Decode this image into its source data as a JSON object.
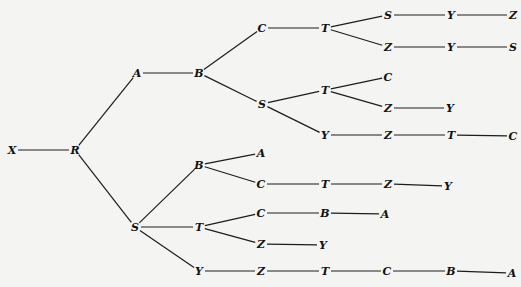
{
  "diagram": {
    "type": "tree",
    "orientation": "left-to-right",
    "colors": {
      "background": "#f4f4f2",
      "ink": "#111111"
    },
    "nodes": [
      {
        "id": "n0",
        "label": "X",
        "x": 12,
        "y": 150
      },
      {
        "id": "n1",
        "label": "R",
        "x": 75,
        "y": 150
      },
      {
        "id": "n2",
        "label": "A",
        "x": 137,
        "y": 73
      },
      {
        "id": "n3",
        "label": "B",
        "x": 199,
        "y": 73
      },
      {
        "id": "n4",
        "label": "C",
        "x": 262,
        "y": 28
      },
      {
        "id": "n5",
        "label": "T",
        "x": 325,
        "y": 28
      },
      {
        "id": "n6",
        "label": "S",
        "x": 388,
        "y": 15
      },
      {
        "id": "n7",
        "label": "Y",
        "x": 451,
        "y": 15
      },
      {
        "id": "n8",
        "label": "Z",
        "x": 513,
        "y": 15
      },
      {
        "id": "n9",
        "label": "Z",
        "x": 388,
        "y": 47
      },
      {
        "id": "n10",
        "label": "Y",
        "x": 451,
        "y": 47
      },
      {
        "id": "n11",
        "label": "S",
        "x": 513,
        "y": 47
      },
      {
        "id": "n12",
        "label": "S",
        "x": 262,
        "y": 104
      },
      {
        "id": "n13",
        "label": "T",
        "x": 325,
        "y": 90
      },
      {
        "id": "n14",
        "label": "C",
        "x": 388,
        "y": 77
      },
      {
        "id": "n15",
        "label": "Z",
        "x": 388,
        "y": 108
      },
      {
        "id": "n16",
        "label": "Y",
        "x": 450,
        "y": 108
      },
      {
        "id": "n17",
        "label": "Y",
        "x": 325,
        "y": 135
      },
      {
        "id": "n18",
        "label": "Z",
        "x": 388,
        "y": 135
      },
      {
        "id": "n19",
        "label": "T",
        "x": 451,
        "y": 135
      },
      {
        "id": "n20",
        "label": "C",
        "x": 513,
        "y": 136
      },
      {
        "id": "n21",
        "label": "S",
        "x": 135,
        "y": 227
      },
      {
        "id": "n22",
        "label": "B",
        "x": 199,
        "y": 165
      },
      {
        "id": "n23",
        "label": "A",
        "x": 261,
        "y": 153
      },
      {
        "id": "n24",
        "label": "C",
        "x": 261,
        "y": 184
      },
      {
        "id": "n25",
        "label": "T",
        "x": 325,
        "y": 184
      },
      {
        "id": "n26",
        "label": "Z",
        "x": 388,
        "y": 184
      },
      {
        "id": "n27",
        "label": "Y",
        "x": 448,
        "y": 186
      },
      {
        "id": "n28",
        "label": "T",
        "x": 199,
        "y": 227
      },
      {
        "id": "n29",
        "label": "C",
        "x": 261,
        "y": 213
      },
      {
        "id": "n30",
        "label": "B",
        "x": 325,
        "y": 213
      },
      {
        "id": "n31",
        "label": "A",
        "x": 385,
        "y": 214
      },
      {
        "id": "n32",
        "label": "Z",
        "x": 261,
        "y": 244
      },
      {
        "id": "n33",
        "label": "Y",
        "x": 323,
        "y": 245
      },
      {
        "id": "n34",
        "label": "Y",
        "x": 199,
        "y": 271
      },
      {
        "id": "n35",
        "label": "Z",
        "x": 261,
        "y": 271
      },
      {
        "id": "n36",
        "label": "T",
        "x": 325,
        "y": 271
      },
      {
        "id": "n37",
        "label": "C",
        "x": 387,
        "y": 271
      },
      {
        "id": "n38",
        "label": "B",
        "x": 451,
        "y": 271
      },
      {
        "id": "n39",
        "label": "A",
        "x": 512,
        "y": 273
      }
    ],
    "edges": [
      [
        "n0",
        "n1"
      ],
      [
        "n1",
        "n2"
      ],
      [
        "n1",
        "n21"
      ],
      [
        "n2",
        "n3"
      ],
      [
        "n3",
        "n4"
      ],
      [
        "n3",
        "n12"
      ],
      [
        "n4",
        "n5"
      ],
      [
        "n5",
        "n6"
      ],
      [
        "n5",
        "n9"
      ],
      [
        "n6",
        "n7"
      ],
      [
        "n7",
        "n8"
      ],
      [
        "n9",
        "n10"
      ],
      [
        "n10",
        "n11"
      ],
      [
        "n12",
        "n13"
      ],
      [
        "n12",
        "n17"
      ],
      [
        "n13",
        "n14"
      ],
      [
        "n13",
        "n15"
      ],
      [
        "n15",
        "n16"
      ],
      [
        "n17",
        "n18"
      ],
      [
        "n18",
        "n19"
      ],
      [
        "n19",
        "n20"
      ],
      [
        "n21",
        "n22"
      ],
      [
        "n21",
        "n28"
      ],
      [
        "n21",
        "n34"
      ],
      [
        "n22",
        "n23"
      ],
      [
        "n22",
        "n24"
      ],
      [
        "n24",
        "n25"
      ],
      [
        "n25",
        "n26"
      ],
      [
        "n26",
        "n27"
      ],
      [
        "n28",
        "n29"
      ],
      [
        "n28",
        "n32"
      ],
      [
        "n29",
        "n30"
      ],
      [
        "n30",
        "n31"
      ],
      [
        "n32",
        "n33"
      ],
      [
        "n34",
        "n35"
      ],
      [
        "n35",
        "n36"
      ],
      [
        "n36",
        "n37"
      ],
      [
        "n37",
        "n38"
      ],
      [
        "n38",
        "n39"
      ]
    ],
    "paths": [
      "X-R-A-B-C-T-S-Y-Z",
      "X-R-A-B-C-T-Z-Y-S",
      "X-R-A-B-S-T-C",
      "X-R-A-B-S-T-Z-Y",
      "X-R-A-B-S-Y-Z-T-C",
      "X-R-S-B-A",
      "X-R-S-B-C-T-Z-Y",
      "X-R-S-T-C-B-A",
      "X-R-S-T-Z-Y",
      "X-R-S-Y-Z-T-C-B-A"
    ]
  }
}
